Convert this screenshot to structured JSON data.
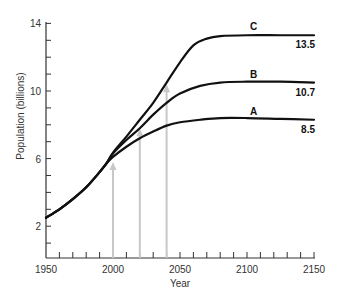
{
  "chart_data": {
    "type": "line",
    "title": "",
    "xlabel": "Year",
    "ylabel": "Population (billions)",
    "xlim": [
      1950,
      2150
    ],
    "ylim": [
      0,
      14
    ],
    "x_ticks": [
      1950,
      2000,
      2050,
      2100,
      2150
    ],
    "x_minor_step": 10,
    "y_ticks": [
      2,
      6,
      10,
      14
    ],
    "y_minor_step": 1,
    "grid": false,
    "legend": "inline labels at curve ends",
    "series": [
      {
        "name": "A",
        "end_value_label": "8.5",
        "points": [
          [
            1950,
            2.5
          ],
          [
            1960,
            3.0
          ],
          [
            1970,
            3.6
          ],
          [
            1980,
            4.3
          ],
          [
            1990,
            5.2
          ],
          [
            1995,
            5.7
          ],
          [
            2000,
            6.1
          ],
          [
            2010,
            6.7
          ],
          [
            2020,
            7.2
          ],
          [
            2030,
            7.6
          ],
          [
            2040,
            7.95
          ],
          [
            2050,
            8.15
          ],
          [
            2065,
            8.3
          ],
          [
            2080,
            8.4
          ],
          [
            2100,
            8.4
          ],
          [
            2125,
            8.35
          ],
          [
            2150,
            8.3
          ]
        ]
      },
      {
        "name": "B",
        "end_value_label": "10.7",
        "points": [
          [
            1950,
            2.5
          ],
          [
            1960,
            3.0
          ],
          [
            1970,
            3.6
          ],
          [
            1980,
            4.3
          ],
          [
            1990,
            5.2
          ],
          [
            1995,
            5.7
          ],
          [
            2000,
            6.3
          ],
          [
            2010,
            7.1
          ],
          [
            2020,
            7.8
          ],
          [
            2030,
            8.6
          ],
          [
            2040,
            9.3
          ],
          [
            2050,
            9.85
          ],
          [
            2065,
            10.3
          ],
          [
            2080,
            10.5
          ],
          [
            2100,
            10.55
          ],
          [
            2125,
            10.55
          ],
          [
            2150,
            10.5
          ]
        ]
      },
      {
        "name": "C",
        "end_value_label": "13.5",
        "points": [
          [
            1950,
            2.5
          ],
          [
            1960,
            3.0
          ],
          [
            1970,
            3.6
          ],
          [
            1980,
            4.3
          ],
          [
            1990,
            5.2
          ],
          [
            1995,
            5.7
          ],
          [
            2000,
            6.35
          ],
          [
            2010,
            7.3
          ],
          [
            2020,
            8.3
          ],
          [
            2030,
            9.3
          ],
          [
            2040,
            10.5
          ],
          [
            2050,
            11.7
          ],
          [
            2060,
            12.7
          ],
          [
            2070,
            13.1
          ],
          [
            2080,
            13.25
          ],
          [
            2100,
            13.3
          ],
          [
            2125,
            13.3
          ],
          [
            2150,
            13.3
          ]
        ]
      }
    ],
    "annotations": [
      {
        "type": "arrow",
        "x": 2000,
        "y_from": 0,
        "y_to": 5.8,
        "color": "#c8c8c8"
      },
      {
        "type": "arrow",
        "x": 2020,
        "y_from": 0,
        "y_to": 7.8,
        "color": "#c8c8c8"
      },
      {
        "type": "arrow",
        "x": 2040,
        "y_from": 0,
        "y_to": 10.4,
        "color": "#c8c8c8"
      }
    ]
  },
  "labels": {
    "xlabel": "Year",
    "ylabel": "Population (billions)",
    "x_ticks": [
      "1950",
      "2000",
      "2050",
      "2100",
      "2150"
    ],
    "y_ticks": [
      "2",
      "6",
      "10",
      "14"
    ],
    "series": [
      "A",
      "B",
      "C"
    ],
    "end_values": [
      "8.5",
      "10.7",
      "13.5"
    ]
  },
  "colors": {
    "line": "#111111",
    "axis": "#333333",
    "arrow": "#c8c8c8"
  }
}
